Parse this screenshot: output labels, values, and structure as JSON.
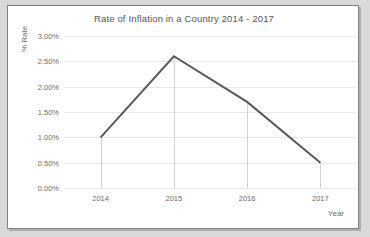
{
  "chart_data": {
    "type": "line",
    "title": "Rate of Inflation in a Country 2014 - 2017",
    "xlabel": "Year",
    "ylabel": "% Rate",
    "categories": [
      "2014",
      "2015",
      "2016",
      "2017"
    ],
    "values": [
      1.0,
      2.6,
      1.7,
      0.5
    ],
    "ylim": [
      0,
      3.0
    ],
    "ytick_step": 0.5,
    "ytick_labels": [
      "0.00%",
      "0.50%",
      "1.00%",
      "1.50%",
      "2.00%",
      "2.50%",
      "3.00%"
    ],
    "ytick_values": [
      0,
      0.5,
      1.0,
      1.5,
      2.0,
      2.5,
      3.0
    ],
    "value_labels": [
      "1.00%",
      "2.60%",
      "1.70%",
      "0.50%"
    ],
    "grid": "horizontal",
    "droplines": true,
    "legend": "none",
    "series": [
      {
        "name": "Rate of Inflation",
        "values": [
          1.0,
          2.6,
          1.7,
          0.5
        ],
        "color": "#595959"
      }
    ],
    "colors": {
      "line": "#595959",
      "gridline": "#e8e8e8",
      "dropline": "#d0d0d0",
      "text": "#6b6b6b",
      "title_text": "#555555",
      "plot_background": "#ffffff",
      "frame_background": "#d9d9d9",
      "border": "#808080"
    }
  }
}
